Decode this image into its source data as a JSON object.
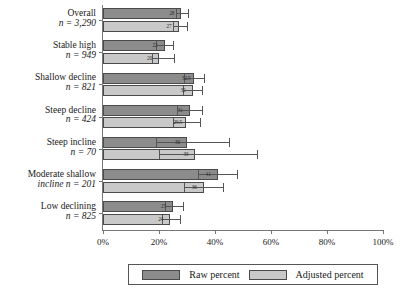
{
  "chart_data": {
    "type": "bar",
    "orientation": "horizontal",
    "title": "",
    "xlabel": "",
    "ylabel": "",
    "xlim": [
      0,
      100
    ],
    "xticks": [
      0,
      20,
      40,
      60,
      80,
      100
    ],
    "xticklabels": [
      "0%",
      "20%",
      "40%",
      "60%",
      "80%",
      "100%"
    ],
    "grid": false,
    "legend_position": "bottom",
    "categories": [
      {
        "label": "Overall",
        "n_text": "n = 3,290"
      },
      {
        "label": "Stable high",
        "n_text": "n = 949"
      },
      {
        "label": "Shallow decline",
        "n_text": "n = 821"
      },
      {
        "label": "Steep decline",
        "n_text": "n = 424"
      },
      {
        "label": "Steep incline",
        "n_text": "n = 70"
      },
      {
        "label": "Moderate shallow",
        "n_text": "incline n = 201"
      },
      {
        "label": "Low declining",
        "n_text": "n = 825"
      }
    ],
    "series": [
      {
        "name": "Raw percent",
        "color": "#8c8c8c",
        "values": [
          28.0,
          22.0,
          32.5,
          31.0,
          30.0,
          41.0,
          25.0
        ],
        "labels": [
          "28",
          "22",
          "32.5",
          "31",
          "30",
          "41",
          "25"
        ],
        "ci_low": [
          26.0,
          19.0,
          29.0,
          26.5,
          19.0,
          34.0,
          22.0
        ],
        "ci_high": [
          30.5,
          25.0,
          36.0,
          35.5,
          45.0,
          48.0,
          28.5
        ]
      },
      {
        "name": "Adjusted percent",
        "color": "#c9c9c9",
        "values": [
          27.0,
          20.0,
          32.0,
          29.5,
          33.0,
          36.0,
          24.0
        ],
        "labels": [
          "27",
          "20",
          "32",
          "29.5",
          "33",
          "36",
          "24"
        ],
        "ci_low": [
          25.0,
          17.5,
          28.5,
          25.0,
          20.0,
          29.0,
          21.0
        ],
        "ci_high": [
          30.0,
          25.5,
          35.5,
          34.5,
          55.0,
          43.0,
          27.5
        ]
      }
    ]
  },
  "legend": {
    "raw_label": "Raw percent",
    "adjusted_label": "Adjusted percent"
  }
}
